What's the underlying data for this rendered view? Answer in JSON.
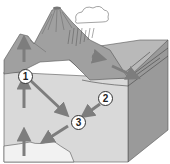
{
  "diagram": {
    "type": "geological block diagram (process cycle)",
    "labels": [
      {
        "id": "1",
        "text": "1"
      },
      {
        "id": "2",
        "text": "2"
      },
      {
        "id": "3",
        "text": "3"
      }
    ],
    "features": [
      "volcano",
      "cloud",
      "rain",
      "mountain slope",
      "sediment layers",
      "arrows"
    ],
    "colors": {
      "light": "#dcdcdc",
      "mid": "#a9a9a9",
      "dark": "#7a7a7a",
      "arrow": "#7d7d7d",
      "outline": "#333333"
    }
  }
}
